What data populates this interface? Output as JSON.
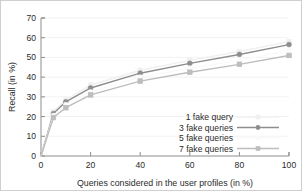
{
  "chart_data": {
    "type": "line",
    "title": "",
    "xlabel": "Queries considered in the user profiles (in %)",
    "ylabel": "Recall (in %)",
    "xlim": [
      0,
      100
    ],
    "ylim": [
      0,
      70
    ],
    "xticks": [
      0,
      20,
      40,
      60,
      80,
      100
    ],
    "yticks": [
      0,
      10,
      20,
      30,
      40,
      50,
      60,
      70
    ],
    "xtick_labels": [
      "0",
      "20",
      "40",
      "60",
      "80",
      "100"
    ],
    "ytick_labels": [
      "0",
      "10",
      "20",
      "30",
      "40",
      "50",
      "60",
      "70"
    ],
    "grid": false,
    "legend_position": "lower-right",
    "x": [
      0,
      5,
      10,
      20,
      40,
      60,
      80,
      100
    ],
    "series": [
      {
        "name": "1 fake query",
        "color": "#f0f0f0",
        "marker": "square",
        "values": [
          0,
          22.5,
          28.5,
          36.0,
          43.5,
          48.5,
          53.0,
          58.0
        ]
      },
      {
        "name": "3 fake queries",
        "color": "#8e8e8e",
        "marker": "circle",
        "values": [
          0,
          21.5,
          27.5,
          34.5,
          42.0,
          47.0,
          51.5,
          56.5
        ]
      },
      {
        "name": "5 fake queries",
        "color": "#fafafa",
        "marker": "circle",
        "values": [
          0,
          20.5,
          26.0,
          32.5,
          40.0,
          44.5,
          48.5,
          53.5
        ]
      },
      {
        "name": "7 fake queries",
        "color": "#bdbdbd",
        "marker": "square",
        "values": [
          0,
          19.5,
          24.5,
          31.0,
          38.0,
          42.5,
          46.5,
          51.0
        ]
      }
    ]
  },
  "legend": {
    "entries": [
      {
        "label": "1 fake query"
      },
      {
        "label": "3 fake queries"
      },
      {
        "label": "5 fake queries"
      },
      {
        "label": "7 fake queries"
      }
    ]
  }
}
